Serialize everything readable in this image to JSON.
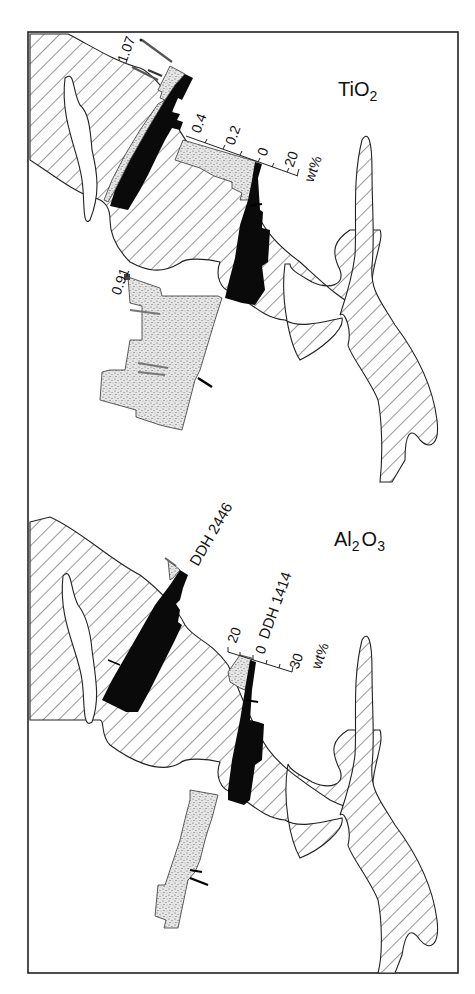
{
  "figure": {
    "type": "geological cross-section with drill-hole geochemical logs",
    "panels": [
      {
        "id": "tio2",
        "title_main": "TiO",
        "title_sub": "2",
        "scale": {
          "left_ticks": [
            "0.4",
            "0.2",
            "0"
          ],
          "right_ticks": [
            "20"
          ],
          "unit": "wt%"
        },
        "annotations": {
          "max_value_hole_2446": "1.07",
          "max_value_hole_1414": "0.91"
        }
      },
      {
        "id": "al2o3",
        "title_parts": [
          "Al",
          "2",
          "O",
          "3"
        ],
        "drill_holes": [
          "DDH 2446",
          "DDH 1414"
        ],
        "scale": {
          "left_ticks": [
            "20"
          ],
          "center_tick": "0",
          "right_ticks": [
            "30"
          ],
          "unit": "wt%"
        }
      }
    ],
    "legend_implied": {
      "hatched": "ore body / orebody outline",
      "black_bars": "right-hand log (wt%)",
      "stippled_bars": "left-hand log (wt%)"
    },
    "colors": {
      "ink": "#111111",
      "background": "#ffffff",
      "stipple": "#9a9a9a"
    }
  }
}
